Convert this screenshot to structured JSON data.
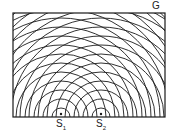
{
  "labels": {
    "screen": "G",
    "source1": "S",
    "source1_sub": "1",
    "source2": "S",
    "source2_sub": "2"
  },
  "diagram": {
    "box": {
      "x": 13,
      "y": 13,
      "width": 152,
      "height": 104
    },
    "sources": [
      {
        "name": "S1",
        "x": 61,
        "y": 117
      },
      {
        "name": "S2",
        "x": 101,
        "y": 117
      }
    ],
    "wavelength": 9,
    "wavefront_count": 16,
    "stroke_color": "#1a1a1a"
  }
}
